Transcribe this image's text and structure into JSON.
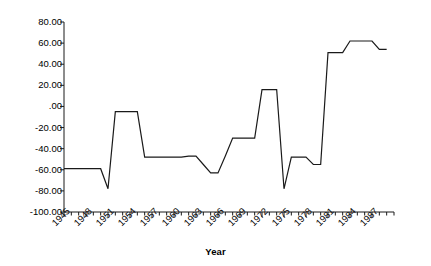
{
  "chart_data": {
    "type": "line",
    "title": "",
    "xlabel": "Year",
    "ylabel": "Political Ideology",
    "xlim": [
      1945,
      1990
    ],
    "ylim": [
      -100,
      80
    ],
    "ytick_labels": [
      "80.00",
      "60.00",
      "40.00",
      "20.00",
      ".00",
      "-20.00",
      "-40.00",
      "-60.00",
      "-80.00",
      "-100.00"
    ],
    "ytick_values": [
      80,
      60,
      40,
      20,
      0,
      -20,
      -40,
      -60,
      -80,
      -100
    ],
    "xtick_labels": [
      "1945",
      "1948",
      "1951",
      "1954",
      "1957",
      "1960",
      "1963",
      "1966",
      "1969",
      "1972",
      "1975",
      "1978",
      "1981",
      "1984",
      "1987"
    ],
    "xtick_values": [
      1945,
      1948,
      1951,
      1954,
      1957,
      1960,
      1963,
      1966,
      1969,
      1972,
      1975,
      1978,
      1981,
      1984,
      1987
    ],
    "minor_tick_interval": 1,
    "grid": false,
    "legend": false,
    "line_color": "#1a1a1a",
    "line_width": 1.2,
    "x": [
      1945,
      1946,
      1947,
      1948,
      1949,
      1950,
      1951,
      1952,
      1953,
      1954,
      1955,
      1956,
      1957,
      1958,
      1959,
      1960,
      1961,
      1962,
      1963,
      1964,
      1965,
      1966,
      1967,
      1968,
      1969,
      1970,
      1971,
      1972,
      1973,
      1974,
      1975,
      1976,
      1977,
      1978,
      1979,
      1980,
      1981,
      1982,
      1983,
      1984,
      1985,
      1986,
      1987,
      1988,
      1989
    ],
    "values": [
      -59,
      -59,
      -59,
      -59,
      -59,
      -59,
      -78,
      -5,
      -5,
      -5,
      -5,
      -48,
      -48,
      -48,
      -48,
      -48,
      -48,
      -47,
      -47,
      -55,
      -63,
      -63,
      -47,
      -30,
      -30,
      -30,
      -30,
      16,
      16,
      16,
      -78,
      -48,
      -48,
      -48,
      -55,
      -55,
      51,
      51,
      51,
      62,
      62,
      62,
      62,
      54,
      54
    ],
    "series": [
      {
        "name": "Political Ideology",
        "values": [
          -59,
          -59,
          -59,
          -59,
          -59,
          -59,
          -78,
          -5,
          -5,
          -5,
          -5,
          -48,
          -48,
          -48,
          -48,
          -48,
          -48,
          -47,
          -47,
          -55,
          -63,
          -63,
          -47,
          -30,
          -30,
          -30,
          -30,
          16,
          16,
          16,
          -78,
          -48,
          -48,
          -48,
          -55,
          -55,
          51,
          51,
          51,
          62,
          62,
          62,
          62,
          54,
          54
        ]
      }
    ]
  }
}
